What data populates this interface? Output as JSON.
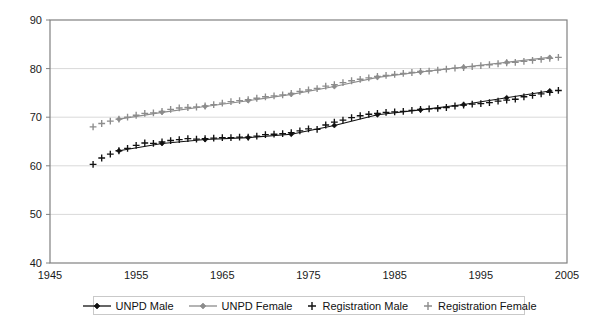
{
  "chart_data": {
    "type": "line",
    "title": "",
    "subtitle": "",
    "xlabel": "",
    "ylabel": "",
    "xlim": [
      1945,
      2005
    ],
    "ylim": [
      40,
      90
    ],
    "xticks": [
      1945,
      1955,
      1965,
      1975,
      1985,
      1995,
      2005
    ],
    "yticks": [
      40,
      50,
      60,
      70,
      80,
      90
    ],
    "grid": true,
    "legend_position": "bottom",
    "series": [
      {
        "name": "UNPD Male",
        "color": "#111111",
        "marker": "diamond",
        "line": true,
        "x": [
          1953,
          1958,
          1963,
          1968,
          1973,
          1978,
          1983,
          1988,
          1993,
          1998,
          2003
        ],
        "values": [
          63.1,
          64.6,
          65.4,
          65.8,
          66.5,
          68.3,
          70.5,
          71.5,
          72.6,
          74.0,
          75.4
        ]
      },
      {
        "name": "UNPD Female",
        "color": "#8c8c8c",
        "marker": "diamond",
        "line": true,
        "x": [
          1953,
          1958,
          1963,
          1968,
          1973,
          1978,
          1983,
          1988,
          1993,
          1998,
          2003
        ],
        "values": [
          69.6,
          71.0,
          72.2,
          73.4,
          74.7,
          76.3,
          78.2,
          79.3,
          80.3,
          81.3,
          82.3
        ]
      },
      {
        "name": "Registration Male",
        "color": "#111111",
        "marker": "plus",
        "line": false,
        "x": [
          1950,
          1951,
          1952,
          1953,
          1954,
          1955,
          1956,
          1957,
          1958,
          1959,
          1960,
          1961,
          1962,
          1963,
          1964,
          1965,
          1966,
          1967,
          1968,
          1969,
          1970,
          1971,
          1972,
          1973,
          1974,
          1975,
          1976,
          1977,
          1978,
          1979,
          1980,
          1981,
          1982,
          1983,
          1984,
          1985,
          1986,
          1987,
          1988,
          1989,
          1990,
          1991,
          1992,
          1993,
          1994,
          1995,
          1996,
          1997,
          1998,
          1999,
          2000,
          2001,
          2002,
          2003,
          2004
        ],
        "values": [
          60.3,
          61.6,
          62.4,
          63.1,
          63.6,
          64.2,
          64.7,
          64.6,
          64.9,
          65.2,
          65.4,
          65.6,
          65.5,
          65.6,
          65.7,
          65.8,
          65.8,
          65.9,
          65.9,
          66.1,
          66.4,
          66.5,
          66.6,
          66.8,
          67.2,
          67.6,
          67.5,
          68.4,
          69.0,
          69.4,
          69.9,
          70.3,
          70.6,
          70.8,
          71.0,
          71.1,
          71.2,
          71.4,
          71.6,
          71.7,
          71.8,
          72.0,
          72.3,
          72.5,
          72.7,
          72.8,
          73.0,
          73.3,
          73.5,
          73.7,
          74.2,
          74.5,
          74.8,
          75.1,
          75.5
        ]
      },
      {
        "name": "Registration Female",
        "color": "#8c8c8c",
        "marker": "plus",
        "line": false,
        "x": [
          1950,
          1951,
          1952,
          1953,
          1954,
          1955,
          1956,
          1957,
          1958,
          1959,
          1960,
          1961,
          1962,
          1963,
          1964,
          1965,
          1966,
          1967,
          1968,
          1969,
          1970,
          1971,
          1972,
          1973,
          1974,
          1975,
          1976,
          1977,
          1978,
          1979,
          1980,
          1981,
          1982,
          1983,
          1984,
          1985,
          1986,
          1987,
          1988,
          1989,
          1990,
          1991,
          1992,
          1993,
          1994,
          1995,
          1996,
          1997,
          1998,
          1999,
          2000,
          2001,
          2002,
          2003,
          2004
        ],
        "values": [
          68.0,
          68.7,
          69.2,
          69.6,
          70.0,
          70.4,
          70.8,
          70.9,
          71.2,
          71.6,
          71.9,
          72.0,
          72.1,
          72.3,
          72.6,
          72.9,
          73.2,
          73.4,
          73.6,
          73.9,
          74.2,
          74.4,
          74.6,
          74.9,
          75.3,
          75.6,
          75.9,
          76.4,
          76.7,
          77.1,
          77.5,
          77.8,
          78.1,
          78.4,
          78.6,
          78.8,
          79.0,
          79.2,
          79.4,
          79.5,
          79.7,
          79.9,
          80.1,
          80.2,
          80.4,
          80.6,
          80.8,
          81.0,
          81.2,
          81.3,
          81.5,
          81.7,
          81.9,
          82.1,
          82.3
        ]
      }
    ]
  },
  "legend": {
    "items": [
      {
        "label": "UNPD Male",
        "swatch": "line-diamond-dark"
      },
      {
        "label": "UNPD Female",
        "swatch": "line-diamond-gray"
      },
      {
        "label": "Registration Male",
        "swatch": "plus-dark"
      },
      {
        "label": "Registration Female",
        "swatch": "plus-gray"
      }
    ]
  },
  "colors": {
    "male": "#111111",
    "female": "#8c8c8c",
    "axis": "#808080",
    "grid": "#d9d9d9",
    "text": "#1a1a1a",
    "background": "#ffffff"
  }
}
